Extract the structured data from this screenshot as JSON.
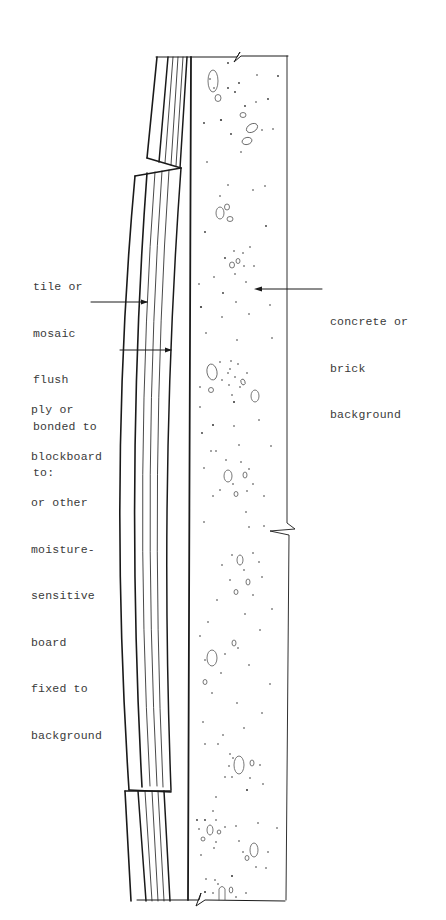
{
  "diagram": {
    "type": "construction-section-detail",
    "stroke_color": "#1a1a1a",
    "text_color": "#3a3a3a",
    "background_color": "#ffffff"
  },
  "labels": {
    "tile": {
      "lines": [
        "tile or",
        "mosaic",
        "flush",
        "bonded to",
        "to:"
      ]
    },
    "ply": {
      "lines": [
        "ply or",
        "blockboard",
        "or other",
        "moisture-",
        "sensitive",
        "board",
        "fixed to",
        "background"
      ]
    },
    "concrete": {
      "lines": [
        "concrete or",
        "brick",
        "background"
      ]
    }
  },
  "components": [
    {
      "id": "tile-layer",
      "name": "tile or mosaic",
      "position": "outer face"
    },
    {
      "id": "board-layer",
      "name": "ply or blockboard",
      "position": "middle, bowed outward between fixings"
    },
    {
      "id": "background",
      "name": "concrete or brick background",
      "position": "right, with aggregate speckle"
    }
  ]
}
